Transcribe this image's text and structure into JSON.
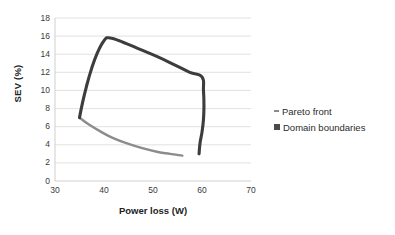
{
  "chart_data": {
    "type": "line",
    "title": "",
    "xlabel": "Power loss (W)",
    "ylabel": "SEV (%)",
    "xlim": [
      30,
      70
    ],
    "ylim": [
      0,
      18
    ],
    "xticks": [
      30,
      40,
      50,
      60,
      70
    ],
    "yticks": [
      0,
      2,
      4,
      6,
      8,
      10,
      12,
      14,
      16,
      18
    ],
    "grid": "horizontal",
    "legend_position": "right",
    "series": [
      {
        "name": "Pareto front",
        "color": "#8c8c8c",
        "marker": "dash",
        "points": [
          [
            35.0,
            7.0
          ],
          [
            37.0,
            6.2
          ],
          [
            39.5,
            5.4
          ],
          [
            42.0,
            4.7
          ],
          [
            45.0,
            4.1
          ],
          [
            48.0,
            3.6
          ],
          [
            51.0,
            3.2
          ],
          [
            53.5,
            3.0
          ],
          [
            56.0,
            2.8
          ]
        ]
      },
      {
        "name": "Domain boundaries",
        "color": "#3d3d3d",
        "marker": "square",
        "points": [
          [
            35.0,
            7.0
          ],
          [
            35.6,
            8.6
          ],
          [
            36.4,
            10.4
          ],
          [
            37.4,
            12.3
          ],
          [
            38.6,
            14.1
          ],
          [
            40.0,
            15.5
          ],
          [
            41.2,
            15.8
          ],
          [
            44.0,
            15.3
          ],
          [
            47.5,
            14.5
          ],
          [
            51.0,
            13.7
          ],
          [
            54.5,
            12.8
          ],
          [
            57.5,
            12.0
          ],
          [
            60.0,
            11.5
          ],
          [
            60.3,
            10.0
          ],
          [
            60.4,
            8.4
          ],
          [
            60.3,
            6.8
          ],
          [
            60.0,
            5.4
          ],
          [
            59.6,
            4.2
          ],
          [
            59.4,
            3.0
          ]
        ]
      }
    ]
  },
  "axes": {
    "y_title": "SEV (%)",
    "x_title": "Power loss (W)",
    "y_tick_labels": [
      "18",
      "16",
      "14",
      "12",
      "10",
      "8",
      "6",
      "4",
      "2",
      "0"
    ],
    "x_tick_labels": [
      "30",
      "40",
      "50",
      "60",
      "70"
    ]
  },
  "legend": {
    "items": [
      {
        "label": "Pareto front",
        "color": "#8c8c8c",
        "marker": "dash"
      },
      {
        "label": "Domain boundaries",
        "color": "#4a4a4a",
        "marker": "square"
      }
    ]
  },
  "colors": {
    "pareto_front": "#8c8c8c",
    "domain_boundaries": "#3d3d3d",
    "gridline": "#d9d9d9",
    "axis": "#d0d0d0",
    "text": "#2b2b2b",
    "background": "#ffffff"
  }
}
